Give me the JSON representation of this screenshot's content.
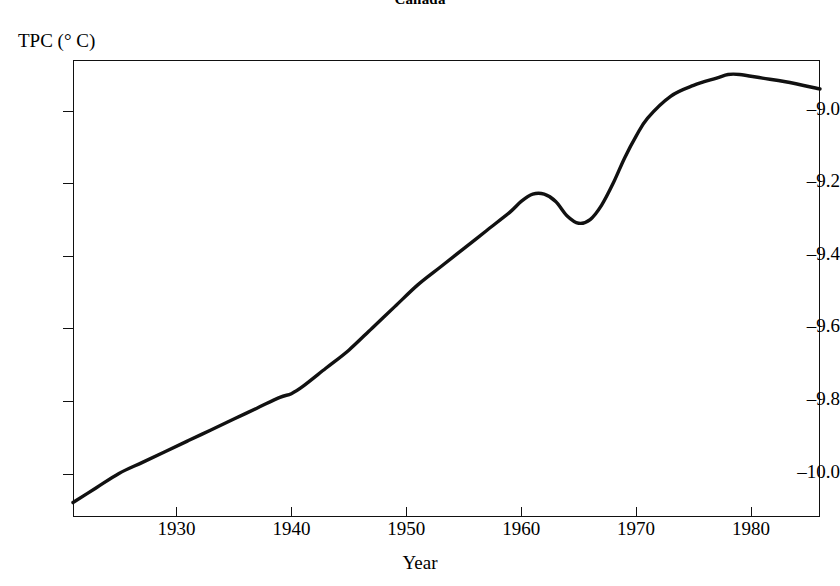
{
  "figure": {
    "title": "Canada",
    "background_color": "#ffffff",
    "line_color": "#111111",
    "frame_color": "#111111"
  },
  "axes": {
    "y_caption": "TPC (° C)",
    "x_caption": "Year",
    "y_ticks": [
      {
        "label": "–9.0",
        "value": -9.0
      },
      {
        "label": "–9.2",
        "value": -9.2
      },
      {
        "label": "–9.4",
        "value": -9.4
      },
      {
        "label": "–9.6",
        "value": -9.6
      },
      {
        "label": "–9.8",
        "value": -9.8
      },
      {
        "label": "–10.0",
        "value": -10.0
      }
    ],
    "x_ticks": [
      {
        "label": "1930",
        "value": 1930
      },
      {
        "label": "1940",
        "value": 1940
      },
      {
        "label": "1950",
        "value": 1950
      },
      {
        "label": "1960",
        "value": 1960
      },
      {
        "label": "1970",
        "value": 1970
      },
      {
        "label": "1980",
        "value": 1980
      }
    ]
  },
  "chart_data": {
    "type": "line",
    "title": "Canada",
    "xlabel": "Year",
    "ylabel": "TPC (° C)",
    "xlim": [
      1921,
      1986
    ],
    "ylim": [
      -10.12,
      -8.86
    ],
    "grid": false,
    "legend": null,
    "series": [
      {
        "name": "TPC",
        "x": [
          1921,
          1923,
          1925,
          1927,
          1929,
          1931,
          1933,
          1935,
          1937,
          1939,
          1940,
          1941,
          1943,
          1945,
          1947,
          1949,
          1951,
          1953,
          1955,
          1957,
          1959,
          1960,
          1961,
          1962,
          1963,
          1964,
          1965,
          1966,
          1967,
          1968,
          1969,
          1970,
          1971,
          1973,
          1975,
          1977,
          1978,
          1979,
          1981,
          1983,
          1986
        ],
        "y": [
          -10.08,
          -10.04,
          -10.0,
          -9.97,
          -9.94,
          -9.91,
          -9.88,
          -9.85,
          -9.82,
          -9.79,
          -9.78,
          -9.76,
          -9.71,
          -9.66,
          -9.6,
          -9.54,
          -9.48,
          -9.43,
          -9.38,
          -9.33,
          -9.28,
          -9.25,
          -9.23,
          -9.23,
          -9.25,
          -9.29,
          -9.31,
          -9.3,
          -9.26,
          -9.2,
          -9.13,
          -9.07,
          -9.02,
          -8.96,
          -8.93,
          -8.91,
          -8.9,
          -8.9,
          -8.91,
          -8.92,
          -8.94
        ]
      }
    ],
    "annotations": {
      "start_value": -10.08,
      "local_max_1961": -9.23,
      "local_min_1965": -9.31,
      "peak_1978": -8.9,
      "end_value": -8.94
    }
  }
}
